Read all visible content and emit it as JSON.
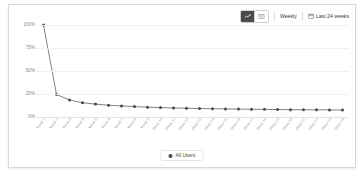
{
  "toolbar": {
    "chart_view_icon": "line-chart-icon",
    "table_view_icon": "table-icon",
    "granularity_label": "Weekly",
    "date_range_label": "Last 24 weeks",
    "calendar_icon": "calendar-icon"
  },
  "legend": {
    "items": [
      {
        "label": "All Users",
        "color": "#4a4a4a"
      }
    ]
  },
  "chart_data": {
    "type": "line",
    "title": "",
    "xlabel": "",
    "ylabel": "",
    "ylim": [
      0,
      100
    ],
    "yticks": [
      0,
      25,
      50,
      75,
      100
    ],
    "ytick_labels": [
      "0%",
      "25%",
      "50%",
      "75%",
      "100%"
    ],
    "grid": true,
    "legend_position": "bottom",
    "marker": "circle",
    "line_color": "#4a4a4a",
    "categories": [
      "Week 1",
      "Week 2",
      "Week 3",
      "Week 4",
      "Week 5",
      "Week 6",
      "Week 7",
      "Week 8",
      "Week 9",
      "Week 10",
      "Week 11",
      "Week 12",
      "Week 13",
      "Week 14",
      "Week 15",
      "Week 16",
      "Week 17",
      "Week 18",
      "Week 19",
      "Week 20",
      "Week 21",
      "Week 22",
      "Week 23",
      "Week 24"
    ],
    "series": [
      {
        "name": "All Users",
        "values": [
          100,
          24.5,
          18.5,
          15.5,
          14,
          12.8,
          12,
          11.3,
          10.7,
          10.2,
          9.8,
          9.5,
          9.2,
          9.0,
          8.8,
          8.6,
          8.4,
          8.3,
          8.1,
          8.0,
          7.9,
          7.8,
          7.7,
          7.6
        ]
      }
    ]
  }
}
